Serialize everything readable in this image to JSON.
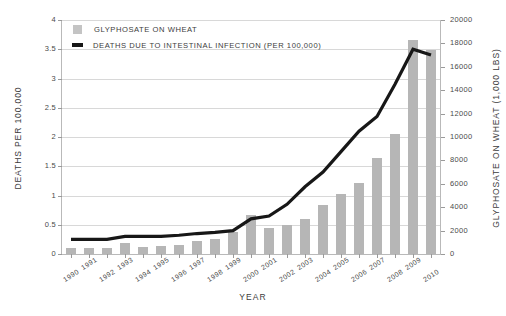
{
  "chart_data": {
    "type": "bar",
    "title": "",
    "xlabel": "Year",
    "ylabel": "Deaths per 100,000",
    "y2label": "Glyphosate on wheat (1,000 lbs)",
    "grid": true,
    "legend_position": "top-left",
    "ylim": [
      0,
      4
    ],
    "y2lim": [
      0,
      20000
    ],
    "xlim": [
      1990,
      2010
    ],
    "y_ticks": [
      "0",
      "0.5",
      "1",
      "1.5",
      "2",
      "2.5",
      "3",
      "3.5",
      "4"
    ],
    "y_tick_values": [
      0,
      0.5,
      1,
      1.5,
      2,
      2.5,
      3,
      3.5,
      4
    ],
    "y2_ticks": [
      "0",
      "2000",
      "4000",
      "6000",
      "8000",
      "10000",
      "12000",
      "14000",
      "16000",
      "18000",
      "20000"
    ],
    "y2_tick_values": [
      0,
      2000,
      4000,
      6000,
      8000,
      10000,
      12000,
      14000,
      16000,
      18000,
      20000
    ],
    "categories": [
      "1990",
      "1991",
      "1992",
      "1993",
      "1994",
      "1995",
      "1996",
      "1997",
      "1998",
      "1999",
      "2000",
      "2001",
      "2002",
      "2003",
      "2004",
      "2005",
      "2006",
      "2007",
      "2008",
      "2009",
      "2010"
    ],
    "series": [
      {
        "name": "Glyphosate on wheat",
        "type": "bar",
        "axis": "right",
        "unit": "1,000 lbs",
        "color": "#b6b6b6",
        "values": [
          500,
          550,
          520,
          900,
          600,
          700,
          800,
          1100,
          1300,
          1900,
          3300,
          2200,
          2500,
          3000,
          4200,
          5100,
          6100,
          8200,
          10300,
          18300,
          17400
        ]
      },
      {
        "name": "Deaths due to intestinal infection (per 100,000)",
        "type": "line",
        "axis": "left",
        "color": "#171717",
        "values": [
          0.25,
          0.25,
          0.25,
          0.3,
          0.3,
          0.3,
          0.32,
          0.35,
          0.37,
          0.4,
          0.6,
          0.65,
          0.85,
          1.15,
          1.4,
          1.75,
          2.1,
          2.35,
          2.9,
          3.5,
          3.4
        ]
      }
    ]
  },
  "legend": {
    "items": [
      {
        "label": "Glyphosate on wheat",
        "marker": "bar-swatch-icon"
      },
      {
        "label": "Deaths due to intestinal infection (per 100,000)",
        "marker": "line-swatch-icon"
      }
    ]
  },
  "axes": {
    "left_title": "Deaths per 100,000",
    "right_title": "Glyphosate on wheat (1,000 lbs)",
    "bottom_title": "Year"
  }
}
